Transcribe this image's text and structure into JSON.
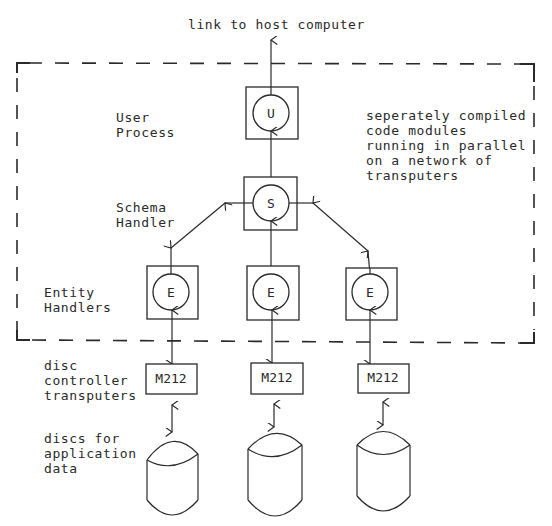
{
  "diagram": {
    "title_link": "link to host computer",
    "boundary_note": [
      "seperately compiled",
      "code modules",
      "running in parallel",
      "on a network of",
      "transputers"
    ],
    "labels": {
      "user_process": [
        "User",
        "Process"
      ],
      "schema_handler": [
        "Schema",
        "Handler"
      ],
      "entity_handlers": [
        "Entity",
        "Handlers"
      ],
      "disc_controllers": [
        "disc",
        "controller",
        "transputers"
      ],
      "discs": [
        "discs for",
        "application",
        "data"
      ]
    },
    "nodes": {
      "user": "U",
      "schema": "S",
      "entities": [
        "E",
        "E",
        "E"
      ],
      "controllers": [
        "M212",
        "M212",
        "M212"
      ]
    },
    "colors": {
      "ink": "#2a2a2a",
      "background": "#ffffff"
    }
  }
}
